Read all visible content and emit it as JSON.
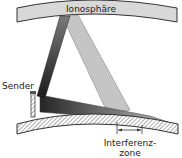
{
  "diagram": {
    "labels": {
      "ionosphere": "Ionosphäre",
      "transmitter": "Sender",
      "interference_line1": "Interferenz-",
      "interference_line2": "zone"
    },
    "colors": {
      "ionosphere_fill": "#d8d8d8",
      "ground_hatch": "#888888",
      "beam_dark": "#2a2a2a",
      "beam_light": "#b0b0b0"
    }
  }
}
